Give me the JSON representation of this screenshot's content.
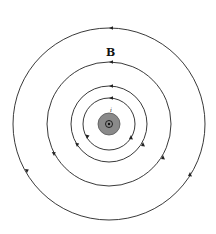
{
  "figure": {
    "title_label": "B",
    "current_label": "i",
    "wire": {
      "fill_color": "#8a8a8a",
      "stroke_color": "#555555",
      "direction_symbol": "dot (current out of page)"
    },
    "field_lines": [
      {
        "radius": 26,
        "arrow_positions": [
          "top",
          "lower-left",
          "lower-right"
        ]
      },
      {
        "radius": 38,
        "arrow_positions": [
          "top",
          "lower-left",
          "lower-right"
        ]
      },
      {
        "radius": 62,
        "arrow_positions": [
          "top",
          "lower-left",
          "lower-right"
        ]
      },
      {
        "radius": 96,
        "arrow_positions": [
          "top",
          "lower-left",
          "lower-right"
        ]
      }
    ],
    "field_direction": "counterclockwise"
  }
}
